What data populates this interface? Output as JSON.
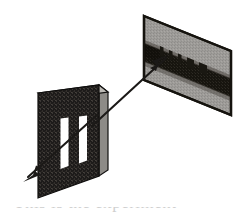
{
  "figure": {
    "background_color": "#ffffff",
    "width": 238,
    "height": 218,
    "caption_partial": "This is the experiment"
  },
  "barrier": {
    "label": "double-slit barrier",
    "face_color": "#1d1b1a",
    "top_edge_color": "#b9b7b3",
    "side_edge_color": "#8f8d89",
    "texture_color": "#3a3734",
    "face_points": "38,93 99,85 99,176 38,198",
    "top_points": "38,93 99,85 108,92 47,100",
    "side_points": "99,85 108,92 108,170 99,176",
    "slits": [
      {
        "label": "slit-left",
        "color": "#ffffff",
        "points": "61,119 69,118 69,165 61,168"
      },
      {
        "label": "slit-right",
        "color": "#ffffff",
        "points": "79,117 87,116 87,160 79,163"
      }
    ]
  },
  "screen": {
    "label": "viewing screen",
    "face_color": "#9d9b98",
    "border_color": "#16140f",
    "band_color": "#17150f",
    "face_points": "144,16 231,51 231,115 144,80",
    "bands": [
      {
        "label": "central-bright-band",
        "points": "144,43 231,78 231,97 144,62"
      }
    ],
    "fringes": [
      {
        "label": "fringe-1",
        "points": "160,46 163,47 163,56 160,55"
      },
      {
        "label": "fringe-2",
        "points": "169,50 172,51 172,59 169,58"
      },
      {
        "label": "fringe-3",
        "points": "178,53 181,54 181,63 178,62"
      },
      {
        "label": "fringe-4",
        "points": "188,57 194,59 194,68 188,66"
      },
      {
        "label": "fringe-5",
        "points": "200,62 207,65 207,74 200,71"
      }
    ]
  },
  "rays": {
    "incident": {
      "label": "incoming-light-ray",
      "color": "#1c1a18",
      "x1": 96,
      "y1": 116,
      "x2": 26,
      "y2": 179,
      "arrow_points": "26,179 39,174 34,170 41,166"
    },
    "diffracted": {
      "label": "diffracted-light-ray",
      "color": "#1c1a18",
      "x1": 93,
      "y1": 123,
      "x2": 167,
      "y2": 57,
      "arrow_points": "167,57 152,62 157,66 150,70"
    }
  }
}
